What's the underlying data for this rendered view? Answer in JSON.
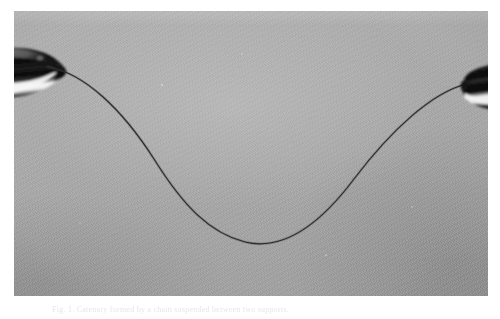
{
  "figure": {
    "kind": "photograph",
    "medium": "black-and-white silver gelatin print on white page",
    "orientation": "landscape"
  },
  "photo": {
    "left": 14,
    "top": 11,
    "width": 474,
    "height": 285,
    "background_color": "#a8a8a8",
    "highlight_color": "#bcbcbc",
    "shadow_color": "#8f8f8f"
  },
  "caption": {
    "label": "Fig. 1.",
    "text": "Catenary formed by a chain suspended between two supports.",
    "full": "Fig. 1. Catenary formed by a chain suspended between two supports.",
    "color": "#e2e2e2"
  },
  "objects": {
    "left_support": {
      "name": "left-clamp-electrode",
      "shape": "conical bullet-shaped metal tip pointing right",
      "center_x": 33,
      "center_y": 62,
      "width": 50,
      "height": 42,
      "body_color": "#141414",
      "highlight_color": "#f2f2f2",
      "rim_color": "#5d5d5d"
    },
    "right_support": {
      "name": "right-clamp-electrode",
      "shape": "blunt cylindrical metal clamp facing left",
      "center_x": 462,
      "center_y": 75,
      "width": 34,
      "height": 44,
      "body_color": "#1a1a1a",
      "highlight_color": "#efefef",
      "rim_color": "#616161"
    },
    "chain": {
      "name": "suspended-chain-curve",
      "stroke_color": "#2a2a2a",
      "stroke_width": 1.1,
      "left_anchor": {
        "x": 34,
        "y": 56
      },
      "right_anchor": {
        "x": 452,
        "y": 73
      },
      "lowest_point": {
        "x": 231,
        "y": 231
      },
      "path": "M 34 56 C 70 62 108 98 140 148 C 170 196 196 222 231 231 C 268 240 304 216 340 168 C 378 118 418 82 452 73"
    },
    "dust_specks": [
      {
        "x": 148,
        "y": 74,
        "r": 1.1,
        "tone": "#dedede"
      },
      {
        "x": 228,
        "y": 43,
        "r": 0.8,
        "tone": "#d6d6d6"
      },
      {
        "x": 312,
        "y": 244,
        "r": 0.9,
        "tone": "#d2d2d2"
      },
      {
        "x": 66,
        "y": 212,
        "r": 0.7,
        "tone": "#cfcfcf"
      },
      {
        "x": 398,
        "y": 196,
        "r": 0.8,
        "tone": "#d8d8d8"
      },
      {
        "x": 250,
        "y": 118,
        "r": 0.6,
        "tone": "#cccccc"
      }
    ]
  },
  "chart_data": {
    "type": "line",
    "xlabel": "horizontal position (px)",
    "ylabel": "vertical position (px, image coordinates)",
    "series": [
      {
        "name": "chain",
        "x": [
          34,
          70,
          110,
          150,
          190,
          231,
          270,
          310,
          350,
          395,
          452
        ],
        "y": [
          56,
          63,
          104,
          160,
          206,
          231,
          230,
          204,
          158,
          104,
          73
        ]
      }
    ],
    "xlim": [
      0,
      474
    ],
    "ylim": [
      285,
      0
    ],
    "grid": false,
    "legend": "none"
  }
}
